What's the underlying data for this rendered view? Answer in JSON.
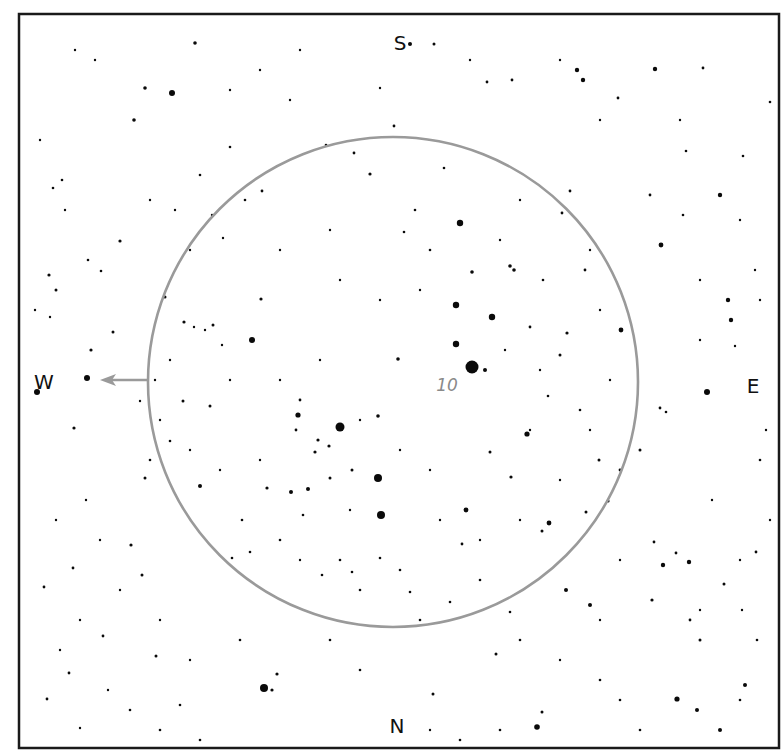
{
  "chart_data": {
    "type": "scatter",
    "title": "",
    "frame": {
      "x": 19,
      "y": 14,
      "width": 760,
      "height": 734
    },
    "fov_circle": {
      "cx": 393,
      "cy": 382,
      "r": 245,
      "color": "#9a9a9a"
    },
    "directions": [
      {
        "label": "S",
        "x": 400,
        "y": 44
      },
      {
        "label": "N",
        "x": 397,
        "y": 727
      },
      {
        "label": "W",
        "x": 44,
        "y": 383
      },
      {
        "label": "E",
        "x": 753,
        "y": 387
      }
    ],
    "object_label": {
      "text": "10",
      "x": 447,
      "y": 386,
      "color": "#8a8a8a"
    },
    "motion_arrow": {
      "from": [
        147,
        380
      ],
      "to": [
        100,
        380
      ],
      "color": "#9a9a9a"
    },
    "stars": [
      [
        472,
        367,
        6.5
      ],
      [
        340,
        427,
        4.5
      ],
      [
        378,
        478,
        4
      ],
      [
        381,
        515,
        4
      ],
      [
        264,
        688,
        4
      ],
      [
        460,
        223,
        3.2
      ],
      [
        456,
        305,
        3.2
      ],
      [
        492,
        317,
        3.2
      ],
      [
        456,
        344,
        3.2
      ],
      [
        252,
        340,
        3
      ],
      [
        87,
        378,
        3
      ],
      [
        37,
        392,
        3
      ],
      [
        707,
        392,
        3
      ],
      [
        172,
        93,
        3
      ],
      [
        298,
        415,
        2.6
      ],
      [
        527,
        434,
        2.6
      ],
      [
        466,
        510,
        2.4
      ],
      [
        549,
        523,
        2.4
      ],
      [
        661,
        245,
        2.4
      ],
      [
        621,
        330,
        2.4
      ],
      [
        577,
        70,
        2.2
      ],
      [
        583,
        80,
        2.2
      ],
      [
        655,
        69,
        2.2
      ],
      [
        720,
        195,
        2.2
      ],
      [
        728,
        300,
        2.2
      ],
      [
        731,
        320,
        2.2
      ],
      [
        689,
        562,
        2.2
      ],
      [
        663,
        565,
        2.2
      ],
      [
        566,
        590,
        2
      ],
      [
        590,
        605,
        2
      ],
      [
        537,
        727,
        2.8
      ],
      [
        677,
        699,
        2.6
      ],
      [
        745,
        685,
        2
      ],
      [
        697,
        710,
        2
      ],
      [
        720,
        730,
        2
      ],
      [
        485,
        370,
        2
      ],
      [
        472,
        272,
        1.8
      ],
      [
        398,
        359,
        1.8
      ],
      [
        378,
        416,
        1.8
      ],
      [
        510,
        266,
        1.8
      ],
      [
        514,
        270,
        1.8
      ],
      [
        200,
        486,
        2
      ],
      [
        291,
        492,
        2
      ],
      [
        308,
        489,
        2
      ],
      [
        318,
        440,
        1.6
      ],
      [
        329,
        446,
        1.6
      ],
      [
        315,
        452,
        1.6
      ],
      [
        330,
        478,
        1.5
      ],
      [
        352,
        470,
        1.5
      ],
      [
        370,
        174,
        1.6
      ],
      [
        410,
        44,
        2
      ],
      [
        434,
        44,
        1.5
      ],
      [
        134,
        120,
        1.8
      ],
      [
        145,
        88,
        1.8
      ],
      [
        195,
        43,
        1.8
      ],
      [
        120,
        241,
        1.6
      ],
      [
        49,
        275,
        1.6
      ],
      [
        56,
        290,
        1.5
      ],
      [
        113,
        332,
        1.5
      ],
      [
        184,
        322,
        1.6
      ],
      [
        213,
        325,
        1.5
      ],
      [
        165,
        297,
        1.5
      ],
      [
        261,
        299,
        1.6
      ],
      [
        300,
        400,
        1.4
      ],
      [
        296,
        430,
        1.4
      ],
      [
        74,
        428,
        1.6
      ],
      [
        91,
        350,
        1.6
      ],
      [
        183,
        401,
        1.5
      ],
      [
        210,
        406,
        1.5
      ],
      [
        267,
        488,
        1.6
      ],
      [
        131,
        545,
        1.6
      ],
      [
        73,
        568,
        1.4
      ],
      [
        44,
        587,
        1.4
      ],
      [
        142,
        575,
        1.5
      ],
      [
        103,
        636,
        1.4
      ],
      [
        277,
        674,
        1.6
      ],
      [
        272,
        690,
        1.6
      ],
      [
        156,
        656,
        1.5
      ],
      [
        69,
        673,
        1.4
      ],
      [
        47,
        699,
        1.4
      ],
      [
        433,
        694,
        1.5
      ],
      [
        542,
        712,
        1.5
      ],
      [
        496,
        654,
        1.5
      ],
      [
        462,
        544,
        1.4
      ],
      [
        490,
        452,
        1.5
      ],
      [
        511,
        477,
        1.6
      ],
      [
        599,
        460,
        1.5
      ],
      [
        542,
        531,
        1.5
      ],
      [
        586,
        512,
        1.5
      ],
      [
        608,
        501,
        1.6
      ],
      [
        640,
        450,
        1.5
      ],
      [
        652,
        600,
        1.6
      ],
      [
        724,
        584,
        1.5
      ],
      [
        654,
        542,
        1.4
      ],
      [
        756,
        552,
        1.4
      ],
      [
        690,
        620,
        1.4
      ],
      [
        700,
        640,
        1.5
      ],
      [
        676,
        553,
        1.4
      ],
      [
        620,
        470,
        1.4
      ],
      [
        560,
        355,
        1.5
      ],
      [
        567,
        333,
        1.6
      ],
      [
        530,
        327,
        1.4
      ],
      [
        585,
        270,
        1.4
      ],
      [
        570,
        191,
        1.4
      ],
      [
        543,
        280,
        1.3
      ],
      [
        562,
        213,
        1.4
      ],
      [
        512,
        80,
        1.4
      ],
      [
        487,
        82,
        1.4
      ],
      [
        618,
        98,
        1.4
      ],
      [
        703,
        68,
        1.4
      ],
      [
        686,
        151,
        1.3
      ],
      [
        770,
        102,
        1.3
      ],
      [
        743,
        156,
        1.3
      ],
      [
        650,
        195,
        1.4
      ],
      [
        683,
        215,
        1.3
      ],
      [
        660,
        408,
        1.4
      ],
      [
        666,
        412,
        1.3
      ],
      [
        580,
        410,
        1.3
      ],
      [
        548,
        396,
        1.3
      ],
      [
        430,
        250,
        1.3
      ],
      [
        415,
        210,
        1.3
      ],
      [
        404,
        232,
        1.3
      ],
      [
        444,
        168,
        1.3
      ],
      [
        354,
        153,
        1.4
      ],
      [
        394,
        126,
        1.4
      ],
      [
        326,
        145,
        1.3
      ],
      [
        262,
        191,
        1.4
      ],
      [
        245,
        200,
        1.3
      ],
      [
        230,
        147,
        1.3
      ],
      [
        200,
        175,
        1.3
      ],
      [
        62,
        180,
        1.3
      ],
      [
        53,
        188,
        1.3
      ],
      [
        88,
        260,
        1.3
      ],
      [
        101,
        271,
        1.3
      ],
      [
        35,
        310,
        1.2
      ],
      [
        50,
        317,
        1.2
      ],
      [
        155,
        380,
        1.2
      ],
      [
        140,
        401,
        1.2
      ],
      [
        150,
        460,
        1.3
      ],
      [
        170,
        441,
        1.3
      ],
      [
        232,
        558,
        1.3
      ],
      [
        242,
        520,
        1.3
      ],
      [
        250,
        552,
        1.3
      ],
      [
        280,
        540,
        1.3
      ],
      [
        303,
        515,
        1.3
      ],
      [
        322,
        575,
        1.3
      ],
      [
        340,
        560,
        1.3
      ],
      [
        352,
        572,
        1.3
      ],
      [
        360,
        590,
        1.3
      ],
      [
        380,
        558,
        1.3
      ],
      [
        400,
        570,
        1.3
      ],
      [
        410,
        592,
        1.3
      ],
      [
        420,
        620,
        1.3
      ],
      [
        450,
        602,
        1.3
      ],
      [
        480,
        580,
        1.3
      ],
      [
        510,
        612,
        1.3
      ],
      [
        520,
        640,
        1.3
      ],
      [
        360,
        670,
        1.3
      ],
      [
        330,
        640,
        1.3
      ],
      [
        240,
        640,
        1.3
      ],
      [
        180,
        705,
        1.3
      ],
      [
        160,
        730,
        1.3
      ],
      [
        130,
        710,
        1.3
      ],
      [
        200,
        740,
        1.3
      ],
      [
        430,
        730,
        1.2
      ],
      [
        460,
        740,
        1.3
      ],
      [
        500,
        730,
        1.3
      ],
      [
        600,
        680,
        1.3
      ],
      [
        620,
        700,
        1.3
      ],
      [
        640,
        730,
        1.3
      ],
      [
        757,
        640,
        1.3
      ],
      [
        740,
        700,
        1.3
      ],
      [
        770,
        520,
        1.2
      ],
      [
        760,
        460,
        1.3
      ],
      [
        766,
        430,
        1.2
      ],
      [
        700,
        340,
        1.2
      ],
      [
        735,
        346,
        1.2
      ],
      [
        760,
        300,
        1.2
      ],
      [
        755,
        270,
        1.2
      ],
      [
        700,
        280,
        1.2
      ],
      [
        740,
        220,
        1.2
      ],
      [
        680,
        120,
        1.2
      ],
      [
        600,
        120,
        1.2
      ],
      [
        560,
        60,
        1.2
      ],
      [
        470,
        60,
        1.2
      ],
      [
        380,
        88,
        1.2
      ],
      [
        300,
        50,
        1.2
      ],
      [
        260,
        70,
        1.2
      ],
      [
        230,
        90,
        1.2
      ],
      [
        290,
        100,
        1.2
      ],
      [
        95,
        60,
        1.2
      ],
      [
        75,
        50,
        1.2
      ],
      [
        40,
        140,
        1.2
      ],
      [
        65,
        210,
        1.2
      ],
      [
        150,
        200,
        1.2
      ],
      [
        175,
        210,
        1.2
      ],
      [
        190,
        250,
        1.2
      ],
      [
        212,
        215,
        1.2
      ],
      [
        223,
        238,
        1.2
      ],
      [
        280,
        250,
        1.2
      ],
      [
        330,
        230,
        1.2
      ],
      [
        340,
        280,
        1.2
      ],
      [
        380,
        300,
        1.2
      ],
      [
        420,
        290,
        1.2
      ],
      [
        500,
        240,
        1.2
      ],
      [
        520,
        200,
        1.2
      ],
      [
        505,
        350,
        1.2
      ],
      [
        540,
        370,
        1.2
      ],
      [
        530,
        430,
        1.2
      ],
      [
        430,
        470,
        1.2
      ],
      [
        400,
        450,
        1.2
      ],
      [
        360,
        420,
        1.2
      ],
      [
        320,
        360,
        1.2
      ],
      [
        280,
        380,
        1.2
      ],
      [
        230,
        380,
        1.2
      ],
      [
        205,
        330,
        1.2
      ],
      [
        194,
        327,
        1.2
      ],
      [
        222,
        345,
        1.2
      ],
      [
        170,
        360,
        1.2
      ],
      [
        160,
        420,
        1.2
      ],
      [
        190,
        450,
        1.2
      ],
      [
        220,
        470,
        1.2
      ],
      [
        260,
        460,
        1.2
      ],
      [
        350,
        510,
        1.2
      ],
      [
        300,
        560,
        1.2
      ],
      [
        440,
        520,
        1.2
      ],
      [
        480,
        540,
        1.2
      ],
      [
        520,
        520,
        1.2
      ],
      [
        560,
        480,
        1.2
      ],
      [
        590,
        430,
        1.2
      ],
      [
        610,
        380,
        1.2
      ],
      [
        600,
        310,
        1.2
      ],
      [
        590,
        250,
        1.2
      ],
      [
        620,
        560,
        1.2
      ],
      [
        600,
        620,
        1.2
      ],
      [
        560,
        660,
        1.2
      ],
      [
        700,
        610,
        1.2
      ],
      [
        742,
        610,
        1.2
      ],
      [
        740,
        560,
        1.2
      ],
      [
        712,
        500,
        1.2
      ],
      [
        86,
        500,
        1.2
      ],
      [
        56,
        520,
        1.2
      ],
      [
        100,
        540,
        1.2
      ],
      [
        120,
        590,
        1.2
      ],
      [
        80,
        620,
        1.2
      ],
      [
        160,
        620,
        1.2
      ],
      [
        190,
        660,
        1.2
      ],
      [
        60,
        650,
        1.2
      ],
      [
        108,
        690,
        1.2
      ],
      [
        80,
        728,
        1.2
      ],
      [
        145,
        478,
        1.5
      ]
    ]
  }
}
